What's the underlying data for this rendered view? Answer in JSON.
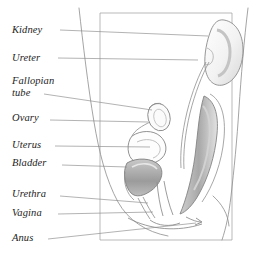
{
  "figure": {
    "style": "pencil line drawing with leader lines to italic serif labels",
    "background_color": "#ffffff",
    "ink_color": "#6f6f6f",
    "leader_color": "#8a8a8a",
    "label_color": "#1d1d1d",
    "shade_color": "#9d9d9d",
    "frame": {
      "left": 100,
      "top": 13,
      "right": 232,
      "bottom": 240
    }
  },
  "labels": [
    {
      "id": "kidney",
      "text": "Kidney",
      "x": 12,
      "y": 24,
      "leader_from_x": 60,
      "leader_from_y": 30,
      "leader_to_x": 208,
      "leader_to_y": 36
    },
    {
      "id": "ureter",
      "text": "Ureter",
      "x": 12,
      "y": 52,
      "leader_from_x": 58,
      "leader_from_y": 58,
      "leader_to_x": 198,
      "leader_to_y": 60
    },
    {
      "id": "fallopian-tube",
      "text": "Fallopian",
      "x": 12,
      "y": 75,
      "line2": "tube",
      "line2_x": 12,
      "line2_y": 87,
      "leader_from_x": 44,
      "leader_from_y": 94,
      "leader_to_x": 152,
      "leader_to_y": 110
    },
    {
      "id": "ovary",
      "text": "Ovary",
      "x": 12,
      "y": 112,
      "leader_from_x": 50,
      "leader_from_y": 120,
      "leader_to_x": 148,
      "leader_to_y": 122
    },
    {
      "id": "uterus",
      "text": "Uterus",
      "x": 12,
      "y": 139,
      "leader_from_x": 55,
      "leader_from_y": 146,
      "leader_to_x": 150,
      "leader_to_y": 147
    },
    {
      "id": "bladder",
      "text": "Bladder",
      "x": 12,
      "y": 157,
      "leader_from_x": 62,
      "leader_from_y": 165,
      "leader_to_x": 127,
      "leader_to_y": 167
    },
    {
      "id": "urethra",
      "text": "Urethra",
      "x": 12,
      "y": 188,
      "leader_from_x": 60,
      "leader_from_y": 196,
      "leader_to_x": 148,
      "leader_to_y": 203
    },
    {
      "id": "vagina",
      "text": "Vagina",
      "x": 12,
      "y": 207,
      "leader_from_x": 58,
      "leader_from_y": 214,
      "leader_to_x": 153,
      "leader_to_y": 212
    },
    {
      "id": "anus",
      "text": "Anus",
      "x": 12,
      "y": 232,
      "leader_from_x": 48,
      "leader_from_y": 239,
      "leader_to_x": 196,
      "leader_to_y": 223
    }
  ],
  "organs": [
    {
      "id": "kidney",
      "name": "Kidney",
      "shape": "bean",
      "cx": 221,
      "cy": 52
    },
    {
      "id": "ureter",
      "name": "Ureter",
      "shape": "tube"
    },
    {
      "id": "ovary",
      "name": "Ovary",
      "shape": "oval",
      "cx": 158,
      "cy": 118
    },
    {
      "id": "fallopian",
      "name": "Fallopian tube",
      "shape": "curve"
    },
    {
      "id": "uterus",
      "name": "Uterus",
      "shape": "pear"
    },
    {
      "id": "bladder",
      "name": "Bladder",
      "shape": "shaded-sac"
    },
    {
      "id": "urethra",
      "name": "Urethra",
      "shape": "tube"
    },
    {
      "id": "vagina",
      "name": "Vagina",
      "shape": "canal"
    },
    {
      "id": "rectum",
      "name": "Rectum",
      "shape": "shaded-column"
    },
    {
      "id": "anus",
      "name": "Anus",
      "shape": "opening"
    }
  ]
}
